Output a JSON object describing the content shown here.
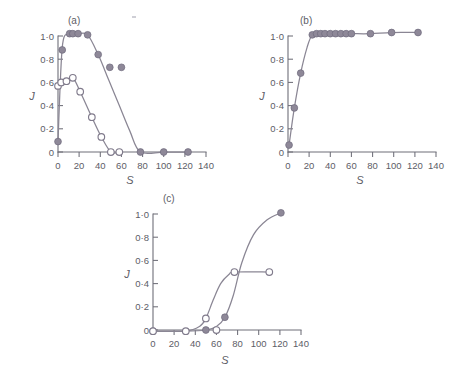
{
  "figure": {
    "background_color": "#ffffff",
    "marker_color": "#8e8898",
    "curve_color": "#8a8694",
    "axis_color": "#6e6e78",
    "text_color": "#5d5d66"
  },
  "panels": {
    "a": {
      "label": "(a)",
      "xlabel": "S",
      "ylabel": "J"
    },
    "b": {
      "label": "(b)",
      "xlabel": "S",
      "ylabel": "J"
    },
    "c": {
      "label": "(c)",
      "xlabel": "S",
      "ylabel": "J"
    }
  },
  "axis_ticks": {
    "x_labels": [
      "0",
      "20",
      "40",
      "60",
      "80",
      "100",
      "120",
      "140"
    ],
    "x_values": [
      0,
      20,
      40,
      60,
      80,
      100,
      120,
      140
    ],
    "y_labels": [
      "0",
      "0·2",
      "0·4",
      "0·6",
      "0·8",
      "1·0"
    ],
    "y_values": [
      0,
      0.2,
      0.4,
      0.6,
      0.8,
      1.0
    ]
  },
  "chart_data": [
    {
      "type": "scatter",
      "panel": "a",
      "title": "(a)",
      "xlabel": "S",
      "ylabel": "J",
      "xlim": [
        0,
        140
      ],
      "ylim": [
        -0.04,
        1.06
      ],
      "grid": false,
      "legend": "none",
      "series": [
        {
          "name": "filled-circles",
          "marker": "filled",
          "x": [
            0,
            4,
            11,
            14,
            19,
            28,
            38,
            49,
            60,
            78,
            100,
            123
          ],
          "y": [
            0.09,
            0.88,
            1.02,
            1.02,
            1.02,
            1.01,
            0.84,
            0.73,
            0.73,
            0.0,
            0.0,
            0.0
          ]
        },
        {
          "name": "open-circles",
          "marker": "open",
          "x": [
            0,
            3,
            8,
            14,
            21,
            32,
            41,
            50,
            58
          ],
          "y": [
            0.57,
            0.6,
            0.61,
            0.64,
            0.52,
            0.3,
            0.13,
            0.0,
            0.0
          ]
        }
      ]
    },
    {
      "type": "scatter",
      "panel": "b",
      "title": "(b)",
      "xlabel": "S",
      "ylabel": "J",
      "xlim": [
        0,
        140
      ],
      "ylim": [
        -0.04,
        1.06
      ],
      "grid": false,
      "legend": "none",
      "series": [
        {
          "name": "filled-circles",
          "marker": "filled",
          "x": [
            1,
            6,
            12,
            23,
            27,
            31,
            35,
            40,
            45,
            50,
            55,
            60,
            78,
            98,
            123
          ],
          "y": [
            0.06,
            0.38,
            0.68,
            1.01,
            1.02,
            1.02,
            1.02,
            1.02,
            1.02,
            1.02,
            1.02,
            1.02,
            1.02,
            1.03,
            1.03
          ]
        }
      ]
    },
    {
      "type": "scatter",
      "panel": "c",
      "title": "(c)",
      "xlabel": "S",
      "ylabel": "J",
      "xlim": [
        0,
        140
      ],
      "ylim": [
        -0.04,
        1.06
      ],
      "grid": false,
      "legend": "none",
      "series": [
        {
          "name": "filled-circles",
          "marker": "filled",
          "x": [
            0,
            50,
            68,
            121
          ],
          "y": [
            -0.01,
            0.0,
            0.11,
            1.01
          ]
        },
        {
          "name": "open-circles",
          "marker": "open",
          "x": [
            0,
            31,
            50,
            60,
            77,
            110
          ],
          "y": [
            -0.01,
            -0.01,
            0.1,
            0.0,
            0.5,
            0.5
          ]
        }
      ]
    }
  ]
}
